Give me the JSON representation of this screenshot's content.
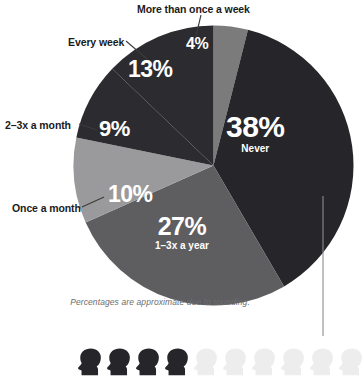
{
  "chart_data": {
    "type": "pie",
    "title": "",
    "subtitle": "",
    "xlabel": "",
    "ylabel": "",
    "legend_position": "callouts",
    "grid": false,
    "footnote": "Percentages are approximate due to rounding.",
    "categories": [
      "More than once a week",
      "Never",
      "1–3x a year",
      "Once a month",
      "2–3x a month",
      "Every week"
    ],
    "values": [
      4,
      38,
      27,
      10,
      9,
      13
    ],
    "slices": [
      {
        "id": "more-than-once-a-week",
        "label": "More than once a week",
        "value": 4,
        "value_text": "4%",
        "inside_sub": "",
        "color": "#7b7b7b",
        "label_placement": "callout"
      },
      {
        "id": "never",
        "label": "Never",
        "value": 38,
        "value_text": "38%",
        "inside_sub": "Never",
        "color": "#26262a",
        "label_placement": "inside"
      },
      {
        "id": "1-3x-a-year",
        "label": "1–3x a year",
        "value": 27,
        "value_text": "27%",
        "inside_sub": "1–3x a year",
        "color": "#5e5e61",
        "label_placement": "inside"
      },
      {
        "id": "once-a-month",
        "label": "Once a month",
        "value": 10,
        "value_text": "10%",
        "inside_sub": "",
        "color": "#9a9a9c",
        "label_placement": "callout"
      },
      {
        "id": "2-3x-a-month",
        "label": "2–3x a month",
        "value": 9,
        "value_text": "9%",
        "inside_sub": "",
        "color": "#2c2c30",
        "label_placement": "callout"
      },
      {
        "id": "every-week",
        "label": "Every week",
        "value": 13,
        "value_text": "13%",
        "inside_sub": "",
        "color": "#2c2c30",
        "label_placement": "callout"
      }
    ]
  },
  "callouts": {
    "more_than_once_a_week": "More than once a week",
    "every_week": "Every week",
    "two_three_x_a_month": "2–3x a month",
    "once_a_month": "Once a month"
  },
  "inside_labels": {
    "never_pct": "38%",
    "never_sub": "Never",
    "year_pct": "27%",
    "year_sub": "1–3x a year",
    "once_pct": "10%",
    "two_three_pct": "9%",
    "every_pct": "13%",
    "more_pct": "4%"
  },
  "footnote": "Percentages are approximate due to rounding.",
  "pictogram": {
    "name": "head-silhouette-row",
    "total": 10,
    "filled": 4,
    "filled_color": "#26262a",
    "empty_color": "#ededed",
    "icon_name": "head-icon"
  },
  "colors": {
    "text_dark": "#1b1b1b",
    "footnote_gray": "#6d6d6d",
    "leader_line": "#6b6b6b",
    "background": "#ffffff"
  }
}
